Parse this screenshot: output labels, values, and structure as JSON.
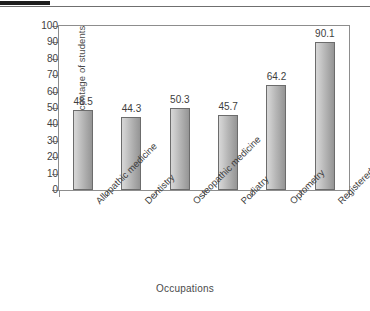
{
  "chart_data": {
    "type": "bar",
    "title": "",
    "xlabel": "Occupations",
    "ylabel": "Percentage of students",
    "categories": [
      "Allopathic medicine",
      "Dentistry",
      "Osteopathic medicine",
      "Podiatry",
      "Optometry",
      "Registered nurses"
    ],
    "values": [
      48.5,
      44.3,
      50.3,
      45.7,
      64.2,
      90.1
    ],
    "value_labels": [
      "48.5",
      "44.3",
      "50.3",
      "45.7",
      "64.2",
      "90.1"
    ],
    "ylim": [
      0,
      100
    ],
    "yticks": [
      100,
      90,
      80,
      70,
      60,
      50,
      40,
      30,
      20,
      10,
      0
    ],
    "ytick_labels": [
      "100",
      "90",
      "80",
      "70",
      "60",
      "50",
      "40",
      "30",
      "20",
      "10",
      "0"
    ],
    "grid": false,
    "legend": null,
    "bar_color": "#b9b9b9",
    "bar_edge_color": "#6c6c6c",
    "axis_color": "#8d8d8d",
    "text_color": "#3f3f3f"
  },
  "artifacts": {
    "top_dark_bar_color": "#1d1d1d",
    "top_rule_color": "#6f6f6f"
  }
}
